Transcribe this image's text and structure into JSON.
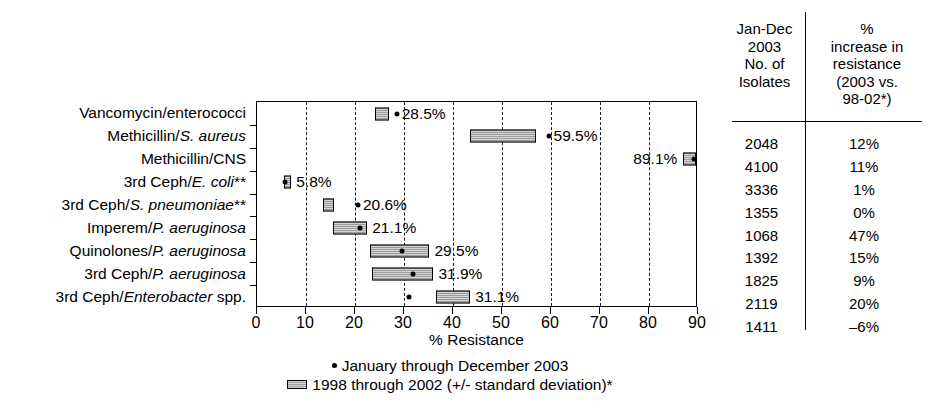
{
  "chart_data": {
    "type": "bar",
    "title": "",
    "xlabel": "% Resistance",
    "ylabel": "",
    "xlim": [
      0,
      90
    ],
    "xticks": [
      0,
      10,
      20,
      30,
      40,
      50,
      60,
      70,
      80,
      90
    ],
    "grid": "vertical dashed gridlines at every 10 units",
    "legend_position": "below axis, centered",
    "categories": [
      "Vancomycin/enterococci",
      "Methicillin/S. aureus",
      "Methicillin/CNS",
      "3rd Ceph/E. coli**",
      "3rd Ceph/S. pneumoniae**",
      "Imperem/P. aeruginosa",
      "Quinolones/P. aeruginosa",
      "3rd Ceph/P. aeruginosa",
      "3rd Ceph/Enterobacter spp."
    ],
    "series": [
      {
        "name": "January through December 2003",
        "marker": "dot",
        "values": [
          28.5,
          59.5,
          89.1,
          5.8,
          20.6,
          21.1,
          29.5,
          31.9,
          31.1
        ]
      },
      {
        "name": "1998 through 2002 (+/- standard deviation)*",
        "marker": "bar",
        "means": [
          25.5,
          50.3,
          88.3,
          6.3,
          14.6,
          19.1,
          29.1,
          29.8,
          36.3
        ],
        "ranges": [
          [
            24.0,
            27.0
          ],
          [
            43.5,
            57.0
          ],
          [
            87.0,
            89.6
          ],
          [
            5.6,
            7.0
          ],
          [
            13.4,
            15.7
          ],
          [
            15.6,
            22.5
          ],
          [
            23.0,
            35.2
          ],
          [
            23.5,
            36.0
          ],
          [
            36.5,
            43.5
          ]
        ]
      }
    ],
    "data_labels": [
      "28.5%",
      "59.5%",
      "89.1%",
      "5.8%",
      "20.6%",
      "21.1%",
      "29.5%",
      "31.9%",
      "31.1%"
    ]
  },
  "axis": {
    "x_title": "% Resistance",
    "x_tick_labels": [
      "0",
      "10",
      "20",
      "30",
      "40",
      "50",
      "60",
      "70",
      "80",
      "90"
    ]
  },
  "legend": {
    "items": [
      {
        "marker": "dot-marker",
        "label": "January through December 2003"
      },
      {
        "marker": "bar-marker",
        "label": "1998 through 2002 (+/- standard deviation)*"
      }
    ]
  },
  "table": {
    "header_left": [
      "Jan-Dec",
      "2003",
      "No. of",
      "Isolates"
    ],
    "header_right": [
      "%",
      "increase in",
      "resistance",
      "(2003 vs.",
      "98-02*)"
    ],
    "rows": [
      {
        "isolates": "2048",
        "increase": "12%"
      },
      {
        "isolates": "4100",
        "increase": "11%"
      },
      {
        "isolates": "3336",
        "increase": "1%"
      },
      {
        "isolates": "1355",
        "increase": "0%"
      },
      {
        "isolates": "1068",
        "increase": "47%"
      },
      {
        "isolates": "1392",
        "increase": "15%"
      },
      {
        "isolates": "1825",
        "increase": "9%"
      },
      {
        "isolates": "2119",
        "increase": "20%"
      },
      {
        "isolates": "1411",
        "increase": "–6%"
      }
    ]
  },
  "category_labels_html": [
    "Vancomycin/enterococci",
    "Methicillin/<i>S. aureus</i>",
    "Methicillin/CNS",
    "3rd Ceph/<i>E. coli</i>**",
    "3rd Ceph/<i>S. pneumoniae</i>**",
    "Imperem/<i>P. aeruginosa</i>",
    "Quinolones/<i>P. aeruginosa</i>",
    "3rd Ceph/<i>P. aeruginosa</i>",
    "3rd Ceph/<i>Enterobacter</i> spp."
  ],
  "colors": {
    "bar_fill": "#9d9d9d",
    "stroke": "#000000",
    "background": "#ffffff"
  }
}
